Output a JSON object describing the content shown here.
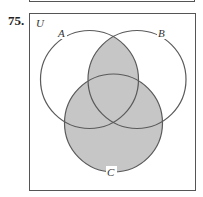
{
  "problem": {
    "number": "75."
  },
  "diagram": {
    "universe_label": "U",
    "sets": [
      {
        "name": "A",
        "label": "A",
        "cx": 89.5,
        "cy": 79.5,
        "r": 49
      },
      {
        "name": "B",
        "label": "B",
        "cx": 137,
        "cy": 79.5,
        "r": 49
      },
      {
        "name": "C",
        "label": "C",
        "cx": 113.5,
        "cy": 123,
        "r": 49
      }
    ],
    "shaded_region": "(A ∩ B) ∪ C",
    "colors": {
      "shade": "#c6c6c6",
      "line": "#5a5a5a",
      "border": "#555555"
    }
  }
}
